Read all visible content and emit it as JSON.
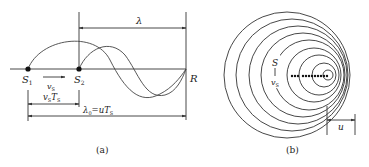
{
  "figure_a": {
    "caption": "(a)",
    "labels": {
      "lambda": "λ",
      "S1": "S",
      "S1_sub": "1",
      "S2": "S",
      "S2_sub": "2",
      "R": "R",
      "vs": "v",
      "vs_sub": "S",
      "vsTs_v": "v",
      "vsTs_sub1": "S",
      "vsTs_T": "T",
      "vsTs_sub2": "S",
      "lambda0_l": "λ",
      "lambda0_sub": "0",
      "lambda0_eq": "=u",
      "lambda0_T": "T",
      "lambda0_sub2": "S"
    }
  },
  "figure_b": {
    "caption": "(b)",
    "labels": {
      "S": "S",
      "vs": "v",
      "vs_sub": "S",
      "u": "u"
    },
    "circles": [
      {
        "cx": 287,
        "r": 63
      },
      {
        "cx": 292,
        "r": 56
      },
      {
        "cx": 298,
        "r": 49
      },
      {
        "cx": 303,
        "r": 42
      },
      {
        "cx": 309,
        "r": 35
      },
      {
        "cx": 314,
        "r": 27
      },
      {
        "cx": 319,
        "r": 20
      },
      {
        "cx": 324,
        "r": 12
      },
      {
        "cx": 328,
        "r": 5
      }
    ]
  }
}
